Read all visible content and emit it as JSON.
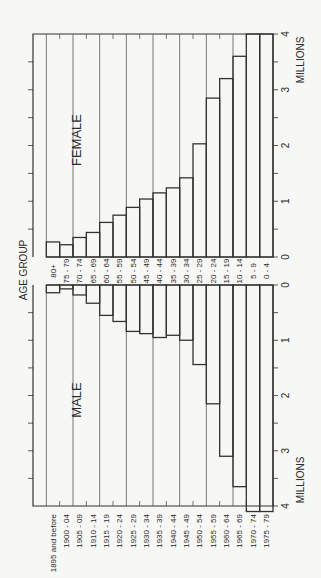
{
  "chart_data": {
    "type": "bar",
    "subtype": "population-pyramid",
    "orientation": "rotated-90-ccw",
    "title": "",
    "categories": [
      "80+",
      "75 - 79",
      "70 - 74",
      "65 - 69",
      "60 - 64",
      "55 - 59",
      "50 - 54",
      "45 - 49",
      "40 - 44",
      "35 - 39",
      "30 - 34",
      "25 - 29",
      "20 - 24",
      "15 - 19",
      "10 - 14",
      "5 - 9",
      "0 - 4"
    ],
    "birth_years": [
      "1895 and before",
      "1900 - 04",
      "1905 - 09",
      "1910 - 14",
      "1915 - 19",
      "1920 - 24",
      "1925 - 29",
      "1930 - 34",
      "1935 - 39",
      "1940 - 44",
      "1945 - 49",
      "1950 - 54",
      "1955 - 59",
      "1960 - 64",
      "1965 - 69",
      "1970 - 74",
      "1975 - 79"
    ],
    "series": [
      {
        "name": "FEMALE",
        "values": [
          0.27,
          0.22,
          0.35,
          0.44,
          0.62,
          0.75,
          0.89,
          1.04,
          1.15,
          1.24,
          1.42,
          2.03,
          2.85,
          3.2,
          3.6,
          4.0,
          4.0
        ]
      },
      {
        "name": "MALE",
        "values": [
          0.14,
          0.07,
          0.18,
          0.33,
          0.55,
          0.66,
          0.84,
          0.88,
          0.95,
          0.91,
          1.0,
          1.44,
          2.15,
          3.1,
          3.65,
          4.1,
          4.1
        ]
      }
    ],
    "category_axis_label": "AGE GROUP",
    "value_axis_label": "MILLIONS",
    "value_ticks": [
      0,
      1,
      2,
      3,
      4
    ],
    "value_range": [
      0,
      4
    ],
    "minor_tick_step": 0.5,
    "grid": true,
    "series_labels": {
      "female": "FEMALE",
      "male": "MALE"
    }
  }
}
